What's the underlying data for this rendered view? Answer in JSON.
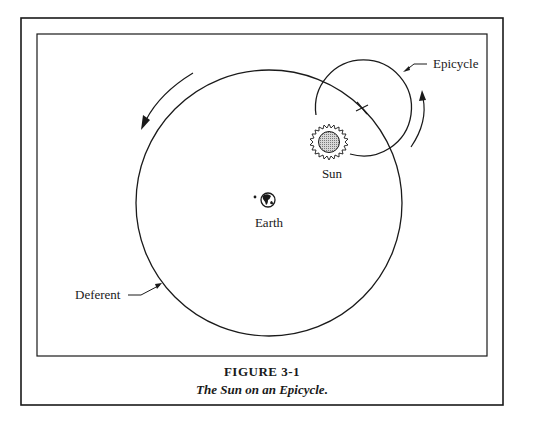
{
  "figure": {
    "number_label": "FIGURE 3-1",
    "caption": "The Sun on an Epicycle."
  },
  "labels": {
    "epicycle": "Epicycle",
    "sun": "Sun",
    "earth": "Earth",
    "deferent": "Deferent"
  },
  "icons": {
    "earth": "globe-icon",
    "sun": "sun-icon",
    "epicycle_center": "cross-marker-icon",
    "deferent_motion": "counterclockwise-arrow-icon",
    "epicycle_motion": "counterclockwise-arrow-icon"
  },
  "colors": {
    "ink": "#1a1a1a",
    "sun_fill": "#b0b0b0",
    "background": "#ffffff"
  }
}
